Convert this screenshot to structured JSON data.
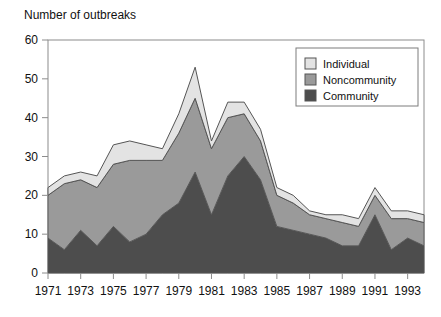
{
  "chart_data": {
    "type": "area",
    "stacked": true,
    "title": "Number of outbreaks",
    "xlabel": "",
    "ylabel": "Number of outbreaks",
    "xlim": [
      1971,
      1994
    ],
    "ylim": [
      0,
      60
    ],
    "yticks": [
      0,
      10,
      20,
      30,
      40,
      50,
      60
    ],
    "xticks": [
      1971,
      1973,
      1975,
      1977,
      1979,
      1981,
      1983,
      1985,
      1987,
      1989,
      1991,
      1993
    ],
    "xtick_labels": [
      "1971",
      "1973",
      "1975",
      "1977",
      "1979",
      "1981",
      "1983",
      "1985",
      "1987",
      "1989",
      "1991",
      "1993"
    ],
    "ytick_labels": [
      "0",
      "10",
      "20",
      "30",
      "40",
      "50",
      "60"
    ],
    "grid": false,
    "legend_position": "top-right",
    "x": [
      1971,
      1972,
      1973,
      1974,
      1975,
      1976,
      1977,
      1978,
      1979,
      1980,
      1981,
      1982,
      1983,
      1984,
      1985,
      1986,
      1987,
      1988,
      1989,
      1990,
      1991,
      1992,
      1993,
      1994
    ],
    "series": [
      {
        "name": "Community",
        "color": "#4d4d4d",
        "values": [
          9,
          6,
          11,
          7,
          12,
          8,
          10,
          15,
          18,
          26,
          15,
          25,
          30,
          24,
          12,
          11,
          10,
          9,
          7,
          7,
          15,
          6,
          9,
          7
        ]
      },
      {
        "name": "Noncommunity",
        "color": "#9a9a9a",
        "values": [
          11,
          17,
          13,
          15,
          16,
          21,
          19,
          14,
          18,
          19,
          17,
          15,
          11,
          10,
          8,
          7,
          5,
          5,
          6,
          5,
          5,
          8,
          5,
          6
        ]
      },
      {
        "name": "Individual",
        "color": "#e3e3e3",
        "values": [
          2,
          2,
          2,
          3,
          5,
          5,
          4,
          3,
          5,
          8,
          2,
          4,
          3,
          3,
          2,
          2,
          1,
          1,
          2,
          2,
          2,
          2,
          2,
          2
        ]
      }
    ],
    "totals": [
      22,
      25,
      26,
      25,
      33,
      34,
      33,
      32,
      41,
      53,
      34,
      44,
      44,
      37,
      22,
      20,
      16,
      15,
      15,
      14,
      22,
      16,
      16,
      15
    ],
    "legend_entries": [
      {
        "label": "Individual",
        "color": "#e3e3e3"
      },
      {
        "label": "Noncommunity",
        "color": "#9a9a9a"
      },
      {
        "label": "Community",
        "color": "#4d4d4d"
      }
    ]
  },
  "plot_geometry": {
    "left": 48,
    "right": 424,
    "top": 40,
    "bottom": 273
  },
  "style": {
    "frame_color": "#8c8c8c",
    "outline_color": "#555555",
    "background": "#ffffff"
  }
}
